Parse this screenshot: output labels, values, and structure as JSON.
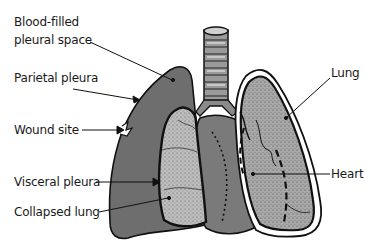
{
  "diagram": {
    "labels": {
      "blood_filled_line1": "Blood-filled",
      "blood_filled_line2": "pleural space",
      "parietal_pleura": "Parietal pleura",
      "wound_site": "Wound site",
      "visceral_pleura": "Visceral pleura",
      "collapsed_lung": "Collapsed lung",
      "lung": "Lung",
      "heart": "Heart"
    },
    "colors": {
      "blood_space": "#6e6e6e",
      "lung_fill": "#b8b8b8",
      "heart_fill": "#7a7a7a",
      "outline": "#111111",
      "trachea": "#9a9a9a",
      "background": "#ffffff"
    }
  }
}
